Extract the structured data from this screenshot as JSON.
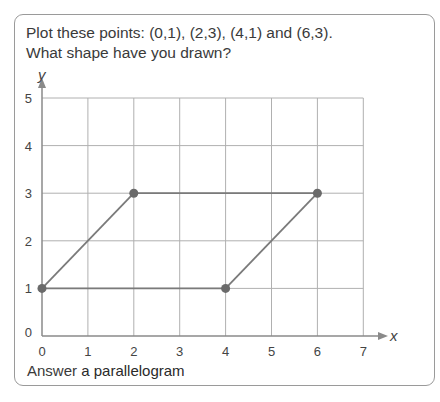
{
  "question": {
    "line1": "Plot these points: (0,1), (2,3), (4,1) and (6,3).",
    "line2": "What shape have you drawn?"
  },
  "answer": {
    "label": "Answer",
    "value": "a parallelogram"
  },
  "colors": {
    "grid": "#b0b0b0",
    "axis": "#8a8a8a",
    "shape_line": "#7a7a7a",
    "point": "#6a6a6a",
    "border": "#9a9a9a"
  },
  "chart_data": {
    "type": "scatter",
    "title": "",
    "xlabel": "x",
    "ylabel": "y",
    "xlim": [
      0,
      7
    ],
    "ylim": [
      0,
      5
    ],
    "x_ticks": [
      "0",
      "1",
      "2",
      "3",
      "4",
      "5",
      "6",
      "7"
    ],
    "y_ticks": [
      "0",
      "1",
      "2",
      "3",
      "4",
      "5"
    ],
    "grid": true,
    "points": [
      {
        "x": 0,
        "y": 1
      },
      {
        "x": 2,
        "y": 3
      },
      {
        "x": 4,
        "y": 1
      },
      {
        "x": 6,
        "y": 3
      }
    ],
    "segments": [
      {
        "from": [
          0,
          1
        ],
        "to": [
          2,
          3
        ]
      },
      {
        "from": [
          2,
          3
        ],
        "to": [
          6,
          3
        ]
      },
      {
        "from": [
          6,
          3
        ],
        "to": [
          4,
          1
        ]
      },
      {
        "from": [
          4,
          1
        ],
        "to": [
          0,
          1
        ]
      }
    ]
  }
}
